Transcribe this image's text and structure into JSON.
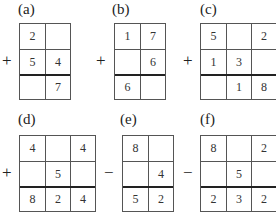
{
  "puzzles": [
    {
      "label": "(a)",
      "operator": "+",
      "rows": [
        [
          "2",
          ""
        ],
        [
          "5",
          "4"
        ],
        [
          "",
          "7"
        ]
      ]
    },
    {
      "label": "(b)",
      "operator": "+",
      "rows": [
        [
          "1",
          "7"
        ],
        [
          "",
          "6"
        ],
        [
          "6",
          ""
        ]
      ]
    },
    {
      "label": "(c)",
      "operator": "+",
      "rows": [
        [
          "5",
          "",
          "2"
        ],
        [
          "1",
          "3",
          ""
        ],
        [
          "",
          "1",
          "8"
        ]
      ]
    },
    {
      "label": "(d)",
      "operator": "+",
      "rows": [
        [
          "4",
          "",
          "4"
        ],
        [
          "",
          "5",
          ""
        ],
        [
          "8",
          "2",
          "4"
        ]
      ]
    },
    {
      "label": "(e)",
      "operator": "−",
      "rows": [
        [
          "8",
          ""
        ],
        [
          "",
          "4"
        ],
        [
          "5",
          "2"
        ]
      ]
    },
    {
      "label": "(f)",
      "operator": "−",
      "rows": [
        [
          "8",
          "",
          "2"
        ],
        [
          "",
          "5",
          ""
        ],
        [
          "2",
          "3",
          "2"
        ]
      ]
    }
  ]
}
